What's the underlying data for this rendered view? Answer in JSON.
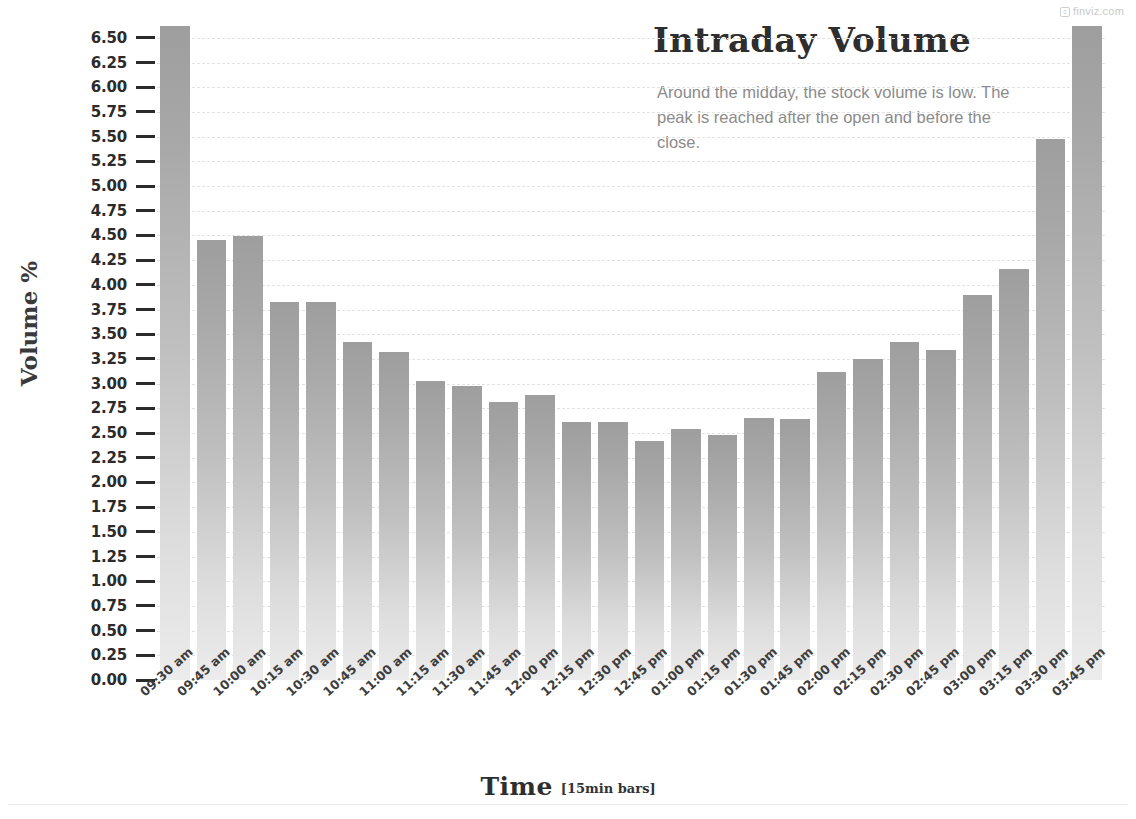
{
  "watermark": {
    "mark": "c",
    "text": "finviz.com"
  },
  "titles": {
    "title": "Intraday Volume",
    "subtitle": "Around the midday, the stock volume is low. The peak is reached after the open and before the close.",
    "y_axis_title": "Volume %",
    "x_axis_title": "Time",
    "x_axis_note": "[15min bars]"
  },
  "chart_data": {
    "type": "bar",
    "title": "Intraday Volume",
    "subtitle": "Around the midday, the stock volume is low. The peak is reached after the open and before the close.",
    "xlabel": "Time",
    "xlabel_note": "[15min bars]",
    "ylabel": "Volume %",
    "ylim": [
      0.0,
      6.62
    ],
    "y_ticks": [
      "0.00",
      "0.25",
      "0.50",
      "0.75",
      "1.00",
      "1.25",
      "1.50",
      "1.75",
      "2.00",
      "2.25",
      "2.50",
      "2.75",
      "3.00",
      "3.25",
      "3.50",
      "3.75",
      "4.00",
      "4.25",
      "4.50",
      "4.75",
      "5.00",
      "5.25",
      "5.50",
      "5.75",
      "6.00",
      "6.25",
      "6.50"
    ],
    "y_tick_values": [
      0.0,
      0.25,
      0.5,
      0.75,
      1.0,
      1.25,
      1.5,
      1.75,
      2.0,
      2.25,
      2.5,
      2.75,
      3.0,
      3.25,
      3.5,
      3.75,
      4.0,
      4.25,
      4.5,
      4.75,
      5.0,
      5.25,
      5.5,
      5.75,
      6.0,
      6.25,
      6.5
    ],
    "grid": true,
    "grid_style": "dashed-horizontal",
    "legend": false,
    "bar_color": "#b4b4b4",
    "bar_gradient": [
      "#9e9e9e",
      "#ececec"
    ],
    "categories": [
      "09:30 am",
      "09:45 am",
      "10:00 am",
      "10:15 am",
      "10:30 am",
      "10:45 am",
      "11:00 am",
      "11:15 am",
      "11:30 am",
      "11:45 am",
      "12:00 pm",
      "12:15 pm",
      "12:30 pm",
      "12:45 pm",
      "01:00 pm",
      "01:15 pm",
      "01:30 pm",
      "01:45 pm",
      "02:00 pm",
      "02:15 pm",
      "02:30 pm",
      "02:45 pm",
      "03:00 pm",
      "03:15 pm",
      "03:30 pm",
      "03:45 pm"
    ],
    "values": [
      6.62,
      4.45,
      4.49,
      3.83,
      3.83,
      3.42,
      3.32,
      3.03,
      2.98,
      2.81,
      2.88,
      2.61,
      2.61,
      2.42,
      2.54,
      2.48,
      2.65,
      2.64,
      3.12,
      3.25,
      3.42,
      3.34,
      3.9,
      4.16,
      5.48,
      6.62
    ]
  }
}
